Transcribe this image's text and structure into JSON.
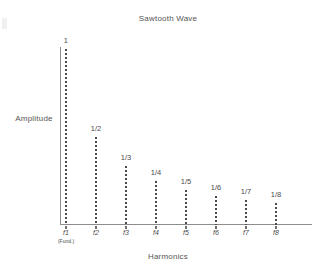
{
  "chart_data": {
    "type": "bar",
    "title": "Sawtooth Wave",
    "xlabel": "Harmonics",
    "ylabel": "Amplitude",
    "categories": [
      "f1",
      "f2",
      "f3",
      "f4",
      "f5",
      "f6",
      "f7",
      "f8"
    ],
    "category_sublabels": [
      "(Fund.)",
      "",
      "",
      "",
      "",
      "",
      "",
      ""
    ],
    "values": [
      1,
      0.5,
      0.3333,
      0.25,
      0.2,
      0.1667,
      0.1429,
      0.125
    ],
    "value_labels": [
      "1",
      "1/2",
      "1/3",
      "1/4",
      "1/5",
      "1/6",
      "1/7",
      "1/8"
    ],
    "ylim": [
      0,
      1
    ],
    "xlim_note": "categorical, 8 evenly spaced harmonics",
    "grid": false,
    "legend": false,
    "series_style": "dashed vertical stems",
    "colors": {
      "stem": "#4a4a4a",
      "axis": "#8d8d8d",
      "text": "#4a4a4a",
      "title": "#555555",
      "background": "#ffffff"
    }
  }
}
